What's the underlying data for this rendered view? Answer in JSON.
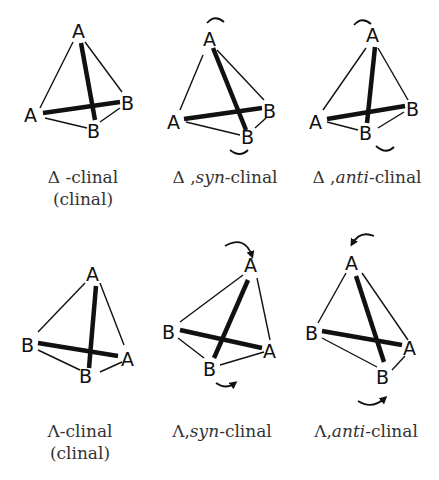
{
  "figure": {
    "panels": [
      {
        "id": "delta-clinal",
        "caption_symbol": "Δ",
        "caption_sep": " -",
        "caption_italic": "",
        "caption_rest": "clinal",
        "caption_line2": "(clinal)",
        "vertices": {
          "top": "A",
          "left": "A",
          "right": "B",
          "front": "B"
        },
        "arrows": []
      },
      {
        "id": "delta-syn-clinal",
        "caption_symbol": "Δ",
        "caption_sep": " ,",
        "caption_italic": "syn",
        "caption_rest": "-clinal",
        "caption_line2": "",
        "vertices": {
          "top": "A",
          "left": "A",
          "right": "B",
          "front": "B"
        },
        "arrows": [
          "top-rotation-arc",
          "bottom-rotation-arc"
        ]
      },
      {
        "id": "delta-anti-clinal",
        "caption_symbol": "Δ",
        "caption_sep": " ,",
        "caption_italic": "anti",
        "caption_rest": "-clinal",
        "caption_line2": "",
        "vertices": {
          "top": "A",
          "left": "A",
          "right": "B",
          "front": "B"
        },
        "arrows": [
          "top-rotation-arc",
          "bottom-rotation-arc"
        ]
      },
      {
        "id": "lambda-clinal",
        "caption_symbol": "Λ",
        "caption_sep": "-",
        "caption_italic": "",
        "caption_rest": "clinal",
        "caption_line2": "(clinal)",
        "vertices": {
          "top": "A",
          "left": "B",
          "right": "A",
          "front": "B"
        },
        "arrows": []
      },
      {
        "id": "lambda-syn-clinal",
        "caption_symbol": "Λ",
        "caption_sep": ",",
        "caption_italic": "syn",
        "caption_rest": "-clinal",
        "caption_line2": "",
        "vertices": {
          "top": "A",
          "left": "B",
          "right": "A",
          "front": "B"
        },
        "arrows": [
          "clockwise-arrow-top",
          "arrow-bottom"
        ]
      },
      {
        "id": "lambda-anti-clinal",
        "caption_symbol": "Λ",
        "caption_sep": ",",
        "caption_italic": "anti",
        "caption_rest": "-clinal",
        "caption_line2": "",
        "vertices": {
          "top": "A",
          "left": "B",
          "right": "A",
          "front": "B"
        },
        "arrows": [
          "counterclockwise-arrow-top",
          "arrow-bottom"
        ]
      }
    ]
  }
}
